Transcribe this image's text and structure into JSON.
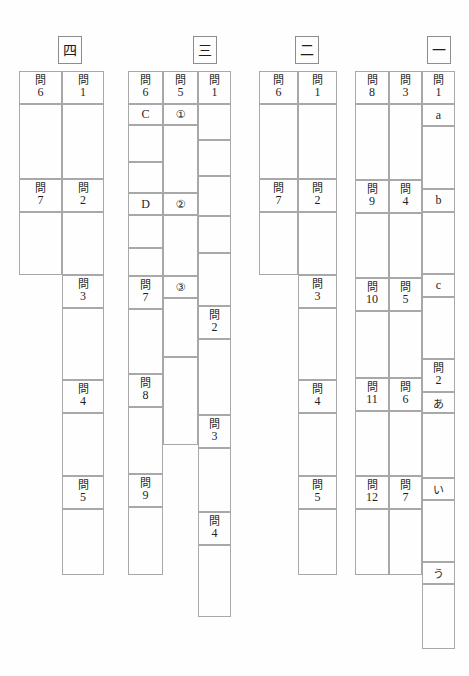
{
  "document": {
    "kind": "japanese-exam-answer-sheet",
    "paper_background": "#fefefe",
    "rule_color": "#a8a8a8",
    "text_color": "#1f1f1f"
  },
  "sections": [
    {
      "id": "section-4",
      "heading": "四",
      "columns": [
        {
          "id": "s4-col-left",
          "cells": [
            {
              "type": "label",
              "kanji": "問",
              "number": "6"
            },
            {
              "type": "answer",
              "value": ""
            },
            {
              "type": "label",
              "kanji": "問",
              "number": "7"
            },
            {
              "type": "answer",
              "value": ""
            }
          ]
        },
        {
          "id": "s4-col-right",
          "cells": [
            {
              "type": "label",
              "kanji": "問",
              "number": "1"
            },
            {
              "type": "answer",
              "value": ""
            },
            {
              "type": "label",
              "kanji": "問",
              "number": "2"
            },
            {
              "type": "answer",
              "value": ""
            },
            {
              "type": "label",
              "kanji": "問",
              "number": "3"
            },
            {
              "type": "answer",
              "value": ""
            },
            {
              "type": "label",
              "kanji": "問",
              "number": "4"
            },
            {
              "type": "answer",
              "value": ""
            },
            {
              "type": "label",
              "kanji": "問",
              "number": "5"
            },
            {
              "type": "answer",
              "value": ""
            }
          ]
        }
      ]
    },
    {
      "id": "section-3",
      "heading": "三",
      "columns": [
        {
          "id": "s3-col-left",
          "cells": [
            {
              "type": "label",
              "kanji": "問",
              "number": "6"
            },
            {
              "type": "glyph",
              "value": "C"
            },
            {
              "type": "answer",
              "value": ""
            },
            {
              "type": "glyph",
              "value": "D"
            },
            {
              "type": "answer",
              "value": ""
            },
            {
              "type": "label",
              "kanji": "問",
              "number": "7"
            },
            {
              "type": "answer",
              "value": ""
            },
            {
              "type": "label",
              "kanji": "問",
              "number": "8"
            },
            {
              "type": "answer",
              "value": ""
            },
            {
              "type": "label",
              "kanji": "問",
              "number": "9"
            },
            {
              "type": "answer",
              "value": ""
            }
          ]
        },
        {
          "id": "s3-col-mid",
          "cells": [
            {
              "type": "label",
              "kanji": "問",
              "number": "5"
            },
            {
              "type": "glyph",
              "value": "①"
            },
            {
              "type": "answer",
              "value": ""
            },
            {
              "type": "glyph",
              "value": "②"
            },
            {
              "type": "answer",
              "value": ""
            },
            {
              "type": "glyph",
              "value": "③"
            },
            {
              "type": "answer",
              "value": ""
            }
          ]
        },
        {
          "id": "s3-col-right",
          "cells": [
            {
              "type": "label",
              "kanji": "問",
              "number": "1"
            },
            {
              "type": "answer",
              "value": ""
            },
            {
              "type": "label",
              "kanji": "問",
              "number": "2"
            },
            {
              "type": "answer",
              "value": ""
            },
            {
              "type": "label",
              "kanji": "問",
              "number": "3"
            },
            {
              "type": "answer",
              "value": ""
            },
            {
              "type": "label",
              "kanji": "問",
              "number": "4"
            },
            {
              "type": "answer",
              "value": ""
            }
          ]
        }
      ]
    },
    {
      "id": "section-2",
      "heading": "二",
      "columns": [
        {
          "id": "s2-col-left",
          "cells": [
            {
              "type": "label",
              "kanji": "問",
              "number": "6"
            },
            {
              "type": "answer",
              "value": ""
            },
            {
              "type": "label",
              "kanji": "問",
              "number": "7"
            },
            {
              "type": "answer",
              "value": ""
            }
          ]
        },
        {
          "id": "s2-col-right",
          "cells": [
            {
              "type": "label",
              "kanji": "問",
              "number": "1"
            },
            {
              "type": "answer",
              "value": ""
            },
            {
              "type": "label",
              "kanji": "問",
              "number": "2"
            },
            {
              "type": "answer",
              "value": ""
            },
            {
              "type": "label",
              "kanji": "問",
              "number": "3"
            },
            {
              "type": "answer",
              "value": ""
            },
            {
              "type": "label",
              "kanji": "問",
              "number": "4"
            },
            {
              "type": "answer",
              "value": ""
            },
            {
              "type": "label",
              "kanji": "問",
              "number": "5"
            },
            {
              "type": "answer",
              "value": ""
            }
          ]
        }
      ]
    },
    {
      "id": "section-1",
      "heading": "一",
      "columns": [
        {
          "id": "s1-col-left",
          "cells": [
            {
              "type": "label",
              "kanji": "問",
              "number": "8"
            },
            {
              "type": "answer",
              "value": ""
            },
            {
              "type": "label",
              "kanji": "問",
              "number": "9"
            },
            {
              "type": "answer",
              "value": ""
            },
            {
              "type": "label",
              "kanji": "問",
              "number": "10"
            },
            {
              "type": "answer",
              "value": ""
            },
            {
              "type": "label",
              "kanji": "問",
              "number": "11"
            },
            {
              "type": "answer",
              "value": ""
            },
            {
              "type": "label",
              "kanji": "問",
              "number": "12"
            },
            {
              "type": "answer",
              "value": ""
            }
          ]
        },
        {
          "id": "s1-col-mid",
          "cells": [
            {
              "type": "label",
              "kanji": "問",
              "number": "3"
            },
            {
              "type": "answer",
              "value": ""
            },
            {
              "type": "label",
              "kanji": "問",
              "number": "4"
            },
            {
              "type": "answer",
              "value": ""
            },
            {
              "type": "label",
              "kanji": "問",
              "number": "5"
            },
            {
              "type": "answer",
              "value": ""
            },
            {
              "type": "label",
              "kanji": "問",
              "number": "6"
            },
            {
              "type": "answer",
              "value": ""
            },
            {
              "type": "label",
              "kanji": "問",
              "number": "7"
            },
            {
              "type": "answer",
              "value": ""
            }
          ]
        },
        {
          "id": "s1-col-right",
          "cells": [
            {
              "type": "label",
              "kanji": "問",
              "number": "1"
            },
            {
              "type": "glyph",
              "value": "a"
            },
            {
              "type": "answer",
              "value": ""
            },
            {
              "type": "glyph",
              "value": "b"
            },
            {
              "type": "answer",
              "value": ""
            },
            {
              "type": "glyph",
              "value": "c"
            },
            {
              "type": "answer",
              "value": ""
            },
            {
              "type": "label",
              "kanji": "問",
              "number": "2"
            },
            {
              "type": "glyph",
              "value": "あ"
            },
            {
              "type": "answer",
              "value": ""
            },
            {
              "type": "glyph",
              "value": "い"
            },
            {
              "type": "answer",
              "value": ""
            },
            {
              "type": "glyph",
              "value": "う"
            },
            {
              "type": "answer",
              "value": ""
            }
          ]
        }
      ]
    }
  ]
}
